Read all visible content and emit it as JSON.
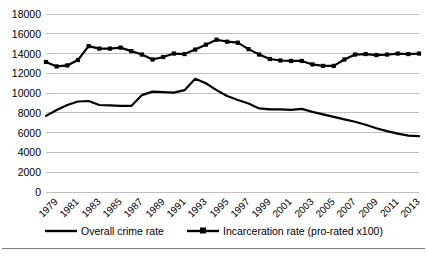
{
  "chart_data": {
    "type": "line",
    "title": "",
    "subtitle": "",
    "xlabel": "",
    "ylabel": "",
    "grid": true,
    "grid_axis": "y",
    "legend_position": "bottom",
    "ylim": [
      0,
      18000
    ],
    "ytick_step": 2000,
    "ytick_labels": [
      "18000",
      "16000",
      "14000",
      "12000",
      "10000",
      "8000",
      "6000",
      "4000",
      "2000",
      "0"
    ],
    "ytick_values": [
      18000,
      16000,
      14000,
      12000,
      10000,
      8000,
      6000,
      4000,
      2000,
      0
    ],
    "x": [
      1979,
      1980,
      1981,
      1982,
      1983,
      1984,
      1985,
      1986,
      1987,
      1988,
      1989,
      1990,
      1991,
      1992,
      1993,
      1994,
      1995,
      1996,
      1997,
      1998,
      1999,
      2000,
      2001,
      2002,
      2003,
      2004,
      2005,
      2006,
      2007,
      2008,
      2009,
      2010,
      2011,
      2012,
      2013,
      2014
    ],
    "xtick_labels": [
      "1979",
      "1981",
      "1983",
      "1985",
      "1987",
      "1989",
      "1991",
      "1993",
      "1995",
      "1997",
      "1999",
      "2001",
      "2003",
      "2005",
      "2007",
      "2009",
      "2011",
      "2013"
    ],
    "xtick_values": [
      1979,
      1981,
      1983,
      1985,
      1987,
      1989,
      1991,
      1993,
      1995,
      1997,
      1999,
      2001,
      2003,
      2005,
      2007,
      2009,
      2011,
      2013
    ],
    "xlim": [
      1979,
      2014
    ],
    "series": [
      {
        "name": "Overall crime rate",
        "marker": "none",
        "color": "#000000",
        "line_width": 2.2,
        "values": [
          7700,
          8300,
          8800,
          9150,
          9200,
          8800,
          8750,
          8700,
          8700,
          9800,
          10150,
          10100,
          10050,
          10300,
          11450,
          11000,
          10300,
          9700,
          9300,
          8950,
          8450,
          8350,
          8350,
          8300,
          8400,
          8100,
          7850,
          7600,
          7350,
          7100,
          6800,
          6450,
          6150,
          5900,
          5700,
          5650
        ]
      },
      {
        "name": "Incarceration rate (pro-rated x100)",
        "marker": "square",
        "color": "#000000",
        "line_width": 2.2,
        "values": [
          13150,
          12700,
          12800,
          13350,
          14750,
          14500,
          14500,
          14600,
          14250,
          13900,
          13400,
          13650,
          14000,
          13950,
          14400,
          14900,
          15400,
          15200,
          15100,
          14450,
          13900,
          13450,
          13300,
          13250,
          13250,
          12900,
          12750,
          12750,
          13400,
          13900,
          13950,
          13850,
          13900,
          14000,
          13950,
          14000
        ]
      }
    ]
  },
  "legend": {
    "items": [
      {
        "label": "Overall crime rate",
        "marker": "line"
      },
      {
        "label": "Incarceration rate (pro-rated x100)",
        "marker": "line-square"
      }
    ]
  }
}
